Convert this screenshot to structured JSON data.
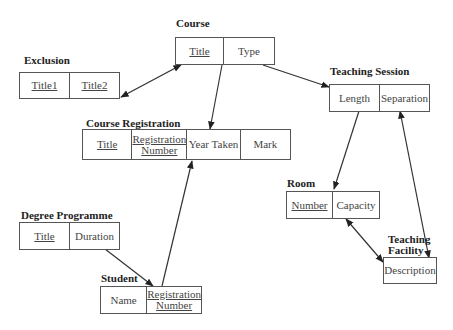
{
  "diagram": {
    "type": "entity-relationship",
    "entities": [
      {
        "id": "course",
        "title": "Course",
        "attributes": [
          {
            "label": "Title",
            "key": true
          },
          {
            "label": "Type",
            "key": false
          }
        ]
      },
      {
        "id": "exclusion",
        "title": "Exclusion",
        "attributes": [
          {
            "label": "Title1",
            "key": true
          },
          {
            "label": "Title2",
            "key": true
          }
        ]
      },
      {
        "id": "teaching-session",
        "title": "Teaching Session",
        "attributes": [
          {
            "label": "Length",
            "key": false
          },
          {
            "label": "Separation",
            "key": false
          }
        ]
      },
      {
        "id": "course-registration",
        "title": "Course Registration",
        "attributes": [
          {
            "label": "Title",
            "key": true
          },
          {
            "label": "Registration Number",
            "key": true
          },
          {
            "label": "Year Taken",
            "key": false
          },
          {
            "label": "Mark",
            "key": false
          }
        ]
      },
      {
        "id": "room",
        "title": "Room",
        "attributes": [
          {
            "label": "Number",
            "key": true
          },
          {
            "label": "Capacity",
            "key": false
          }
        ]
      },
      {
        "id": "degree-programme",
        "title": "Degree Programme",
        "attributes": [
          {
            "label": "Title",
            "key": true
          },
          {
            "label": "Duration",
            "key": false
          }
        ]
      },
      {
        "id": "student",
        "title": "Student",
        "attributes": [
          {
            "label": "Name",
            "key": false
          },
          {
            "label": "Registration Number",
            "key": true
          }
        ]
      },
      {
        "id": "teaching-facility",
        "title": "Teaching Facility",
        "attributes": [
          {
            "label": "Description",
            "key": false
          }
        ]
      }
    ],
    "relationships": [
      {
        "from": "exclusion",
        "to": "course",
        "kind": "bidirectional"
      },
      {
        "from": "course",
        "to": "course-registration",
        "kind": "directed"
      },
      {
        "from": "course",
        "to": "teaching-session",
        "kind": "directed"
      },
      {
        "from": "teaching-session",
        "to": "room",
        "kind": "directed"
      },
      {
        "from": "teaching-session",
        "to": "teaching-facility",
        "kind": "bidirectional"
      },
      {
        "from": "room",
        "to": "teaching-facility",
        "kind": "bidirectional"
      },
      {
        "from": "degree-programme",
        "to": "student",
        "kind": "directed"
      },
      {
        "from": "student",
        "to": "course-registration",
        "kind": "directed"
      }
    ]
  }
}
